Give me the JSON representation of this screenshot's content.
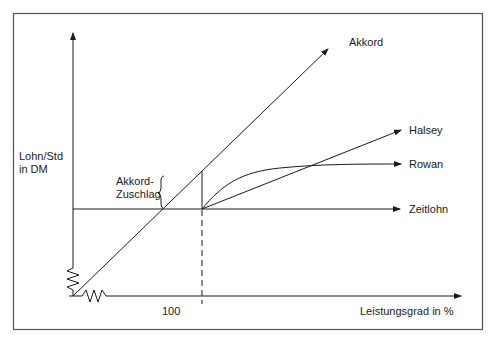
{
  "diagram": {
    "y_axis_label": "Lohn/Std\nin DM",
    "x_axis_label": "Leistungsgrad in %",
    "x_tick_label": "100",
    "bracket_label": "Akkord-\nZuschlag",
    "curves": [
      {
        "id": "akkord",
        "label": "Akkord"
      },
      {
        "id": "halsey",
        "label": "Halsey"
      },
      {
        "id": "rowan",
        "label": "Rowan"
      },
      {
        "id": "zeitlohn",
        "label": "Zeitlohn"
      }
    ],
    "colors": {
      "line": "#1a1a1a",
      "frame": "#555555",
      "background": "#ffffff"
    }
  }
}
